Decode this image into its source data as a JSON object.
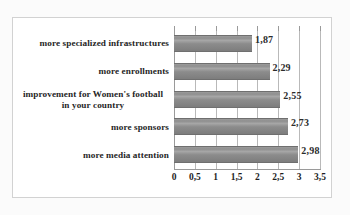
{
  "chart_data": {
    "type": "bar",
    "orientation": "horizontal",
    "title": "",
    "xlabel": "",
    "ylabel": "",
    "xlim": [
      0,
      3.5
    ],
    "grid": true,
    "legend": false,
    "decimal_separator": ",",
    "categories": [
      "more specialized infrastructures",
      "more enrollments",
      "improvement for Women's football in your country",
      "more sponsors",
      "more media attention"
    ],
    "category_lines": [
      [
        "more specialized infrastructures"
      ],
      [
        "more enrollments"
      ],
      [
        "improvement for Women's football",
        "in your country"
      ],
      [
        "more sponsors"
      ],
      [
        "more media attention"
      ]
    ],
    "values": [
      1.87,
      2.29,
      2.55,
      2.73,
      2.98
    ],
    "value_labels": [
      "1,87",
      "2,29",
      "2,55",
      "2,73",
      "2,98"
    ],
    "xticks": [
      0,
      0.5,
      1,
      1.5,
      2,
      2.5,
      3,
      3.5
    ],
    "xtick_labels": [
      "0",
      "0,5",
      "1",
      "1,5",
      "2",
      "2,5",
      "3",
      "3,5"
    ],
    "colors": {
      "bar_fill": "#8f8f8f",
      "bar_edge": "#6f6f6f",
      "gridline": "#b9b9b9",
      "axis": "#9a9a9a",
      "text": "#262626",
      "plot_background": "#ffffff",
      "page_background": "#fbfbfb",
      "frame_border": "#d2d2d2"
    }
  }
}
